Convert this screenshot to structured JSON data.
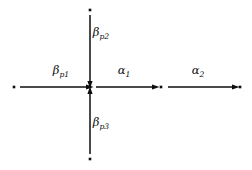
{
  "diagram": {
    "type": "root-system-vector-diagram",
    "background_color": "#ffffff",
    "ink_color": "#0d0d0d",
    "nodes": [
      {
        "id": "node-left",
        "name": "left-node-dot",
        "x": 14,
        "y": 87
      },
      {
        "id": "node-center",
        "name": "center-node-dot",
        "x": 90,
        "y": 87
      },
      {
        "id": "node-mid",
        "name": "middle-node-dot",
        "x": 161,
        "y": 87
      },
      {
        "id": "node-right",
        "name": "right-node-dot",
        "x": 240,
        "y": 87
      },
      {
        "id": "node-top",
        "name": "top-node-dot",
        "x": 90,
        "y": 10
      },
      {
        "id": "node-bottom",
        "name": "bottom-node-dot",
        "x": 90,
        "y": 159
      }
    ],
    "arrows": [
      {
        "id": "arrow-beta-p1",
        "name": "arrow-beta-p1",
        "from": "node-left",
        "to": "node-center",
        "direction": "right",
        "x1": 20,
        "y1": 87,
        "x2": 86,
        "y2": 87,
        "label": "β",
        "subscript": "p1",
        "label_x": 61,
        "label_y": 74
      },
      {
        "id": "arrow-beta-p2",
        "name": "arrow-beta-p2",
        "from": "node-top",
        "to": "node-center",
        "direction": "down",
        "x1": 90,
        "y1": 15,
        "x2": 90,
        "y2": 81,
        "label": "β",
        "subscript": "p2",
        "label_x": 101,
        "label_y": 36
      },
      {
        "id": "arrow-beta-p3",
        "name": "arrow-beta-p3",
        "from": "node-bottom",
        "to": "node-center",
        "direction": "up",
        "x1": 90,
        "y1": 154,
        "x2": 90,
        "y2": 94,
        "label": "β",
        "subscript": "p3",
        "label_x": 101,
        "label_y": 126
      },
      {
        "id": "arrow-alpha-1",
        "name": "arrow-alpha-1",
        "from": "node-center",
        "to": "node-mid",
        "direction": "right",
        "x1": 96,
        "y1": 87,
        "x2": 152,
        "y2": 87,
        "label": "α",
        "subscript": "1",
        "label_x": 124,
        "label_y": 74
      },
      {
        "id": "arrow-alpha-2",
        "name": "arrow-alpha-2",
        "from": "node-mid",
        "to": "node-right",
        "direction": "right",
        "x1": 168,
        "y1": 87,
        "x2": 232,
        "y2": 87,
        "label": "α",
        "subscript": "2",
        "label_x": 198,
        "label_y": 74
      }
    ]
  }
}
